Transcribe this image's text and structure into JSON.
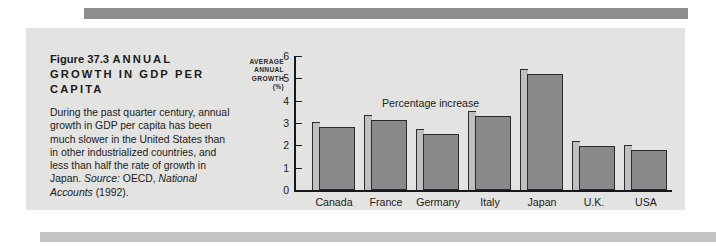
{
  "figure": {
    "number": "Figure 37.3",
    "title": "ANNUAL GROWTH IN GDP PER CAPITA",
    "body": "During the past quarter century, annual growth in GDP per capita has been much slower in the United States than in other industrialized countries, and less than half the rate of growth in Japan.",
    "body_emphasis": "half",
    "source_label": "Source:",
    "source_text": "OECD,",
    "source_publication": "National Accounts",
    "source_year": "(1992)."
  },
  "colors": {
    "panel_background": "#e3e3e1",
    "bar_front": "#8a8a8a",
    "bar_side": "#c0c0c0",
    "bar_outline": "#2b2b2b",
    "axis": "#15181c",
    "band_top": "#8e8e8e",
    "band_bottom": "#c3c3c3",
    "text": "#1b1b1b"
  },
  "chart_data": {
    "type": "bar",
    "title": "ANNUAL GROWTH IN GDP PER CAPITA",
    "annotation": "Percentage increase",
    "categories": [
      "Canada",
      "France",
      "Germany",
      "Italy",
      "Japan",
      "U.K.",
      "USA"
    ],
    "values": [
      2.8,
      3.15,
      2.5,
      3.3,
      5.2,
      1.95,
      1.8
    ],
    "xlabel": "",
    "ylabel": "AVERAGE ANNUAL GROWTH (%)",
    "ylabel_lines": [
      "AVERAGE",
      "ANNUAL",
      "GROWTH",
      "(%)"
    ],
    "ylim": [
      0,
      6
    ],
    "yticks": [
      0,
      1,
      2,
      3,
      4,
      5,
      6
    ],
    "ytick_labels": [
      "0",
      "1",
      "2",
      "3",
      "4",
      "5",
      "6"
    ],
    "grid": false,
    "legend": "none"
  }
}
